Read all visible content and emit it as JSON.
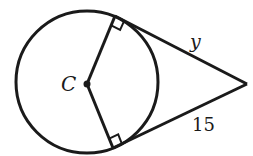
{
  "diagram": {
    "type": "circle-tangent-segments",
    "center_label": "C",
    "labels": {
      "top_tangent": "y",
      "bottom_tangent": "15"
    },
    "colors": {
      "stroke": "#1a1a1a",
      "background": "#ffffff"
    }
  }
}
